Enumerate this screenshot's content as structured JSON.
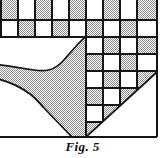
{
  "figure": {
    "caption": "Fig. 5",
    "colors": {
      "ink": "#151515",
      "paper": "#ffffff",
      "hatch_fill": "#b9b9b9",
      "hatch_line": "#8a8a8a"
    },
    "geometry": {
      "cell_size": 17,
      "grid_left": 1,
      "grid_right": 157,
      "divider_x": 86,
      "baseline_y": 137,
      "strip_rows_y": [
        3,
        20,
        37
      ]
    },
    "top_strip": {
      "label": "checkerboard-strip",
      "row_1": [
        "shaded",
        "plain",
        "shaded",
        "plain",
        "shaded",
        "plain",
        "shaded",
        "plain",
        "shaded"
      ],
      "row_2": [
        "plain",
        "shaded",
        "plain",
        "shaded",
        "plain",
        "shaded",
        "plain",
        "shaded",
        "plain"
      ]
    },
    "left_panel": {
      "label": "curved-region",
      "fill": "hatch",
      "outline_path": "M 1 38 L 86 38 L 86 37 L 86 137 L 70 137 L 1 68 Z",
      "description": "hatched band with concave curved waist running from upper right to lower left"
    },
    "right_panel": {
      "label": "checkerboard-triangle",
      "rows": [
        [
          "plain",
          "shaded",
          "plain",
          "shaded"
        ],
        [
          "shaded",
          "plain",
          "shaded",
          "plain"
        ],
        [
          "plain",
          "shaded",
          "plain",
          "shaded"
        ],
        [
          "shaded",
          "plain",
          "shaded",
          "plain"
        ],
        [
          "plain",
          "shaded",
          "plain",
          "plain"
        ],
        [
          "shaded",
          "plain",
          "plain",
          "plain"
        ]
      ],
      "diagonal": {
        "from_x": 86,
        "from_y": 137,
        "to_x": 157,
        "to_y": 72
      }
    }
  }
}
